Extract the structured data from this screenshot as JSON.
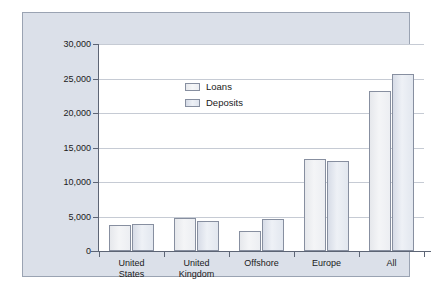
{
  "chart_data": {
    "type": "bar",
    "title": "",
    "subtitle": "",
    "xlabel": "",
    "ylabel": "",
    "categories": [
      "United States",
      "United Kingdom",
      "Offshore",
      "Europe",
      "All"
    ],
    "series": [
      {
        "name": "Loans",
        "values": [
          3700,
          4800,
          2900,
          13400,
          23200
        ]
      },
      {
        "name": "Deposits",
        "values": [
          3900,
          4400,
          4700,
          13000,
          25700
        ]
      }
    ],
    "ylim": [
      0,
      30000
    ],
    "ytick_values": [
      0,
      5000,
      10000,
      15000,
      20000,
      25000,
      30000
    ],
    "ytick_labels": [
      "0",
      "5,000",
      "10,000",
      "15,000",
      "20,000",
      "25,000",
      "30,000"
    ],
    "grid": true,
    "legend_position": "top-left-inside",
    "colors": {
      "panel_background": "#dbe0e9",
      "plot_background": "#ffffff",
      "panel_border": "#9aa3b2",
      "axis": "#5d6575",
      "gridline": "#c6cbd4",
      "bar_border": "#878fa0",
      "loans_fill": "#f1f2f5",
      "deposits_fill": "#e4e9f1",
      "text": "#1a1a1a"
    }
  },
  "legend": {
    "items": [
      {
        "label": "Loans"
      },
      {
        "label": "Deposits"
      }
    ]
  },
  "axes": {
    "y_labels": [
      "30,000",
      "25,000",
      "20,000",
      "15,000",
      "10,000",
      "5,000",
      "0"
    ],
    "x_labels": [
      "United\nStates",
      "United\nKingdom",
      "Offshore",
      "Europe",
      "All"
    ]
  }
}
